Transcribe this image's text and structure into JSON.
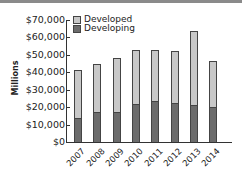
{
  "chart_data": {
    "type": "bar",
    "stacked": true,
    "title": "",
    "xlabel": "",
    "ylabel": "Millions",
    "ylim": [
      0,
      70000
    ],
    "yticks": [
      "$0",
      "$10,000",
      "$20,000",
      "$30,000",
      "$40,000",
      "$50,000",
      "$60,000",
      "$70,000"
    ],
    "categories": [
      "2007",
      "2008",
      "2009",
      "2010",
      "2011",
      "2012",
      "2013",
      "2014"
    ],
    "series": [
      {
        "name": "Developing",
        "color": "#6c6c6c",
        "values": [
          14000,
          17000,
          17000,
          22000,
          23500,
          22500,
          21000,
          20000
        ]
      },
      {
        "name": "Developed",
        "color": "#c8c8c8",
        "values": [
          27500,
          27500,
          31000,
          31000,
          29500,
          30000,
          42500,
          26500
        ]
      }
    ],
    "totals": [
      41500,
      44500,
      48000,
      53000,
      53000,
      52500,
      63500,
      46500
    ],
    "legend": {
      "position": "top-left-inside",
      "entries": [
        "Developed",
        "Developing"
      ]
    },
    "grid": false
  }
}
